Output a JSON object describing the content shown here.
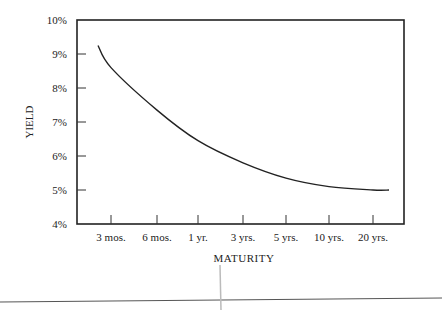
{
  "chart_data": {
    "type": "line",
    "title": "",
    "xlabel": "MATURITY",
    "ylabel": "YIELD",
    "categories": [
      "3 mos.",
      "6 mos.",
      "1 yr.",
      "3 yrs.",
      "5 yrs.",
      "10 yrs.",
      "20 yrs."
    ],
    "yticks": [
      "4%",
      "5%",
      "6%",
      "7%",
      "8%",
      "9%",
      "10%"
    ],
    "ylim": [
      4,
      10
    ],
    "grid": false,
    "legend": null,
    "series": [
      {
        "name": "Yield curve",
        "values": [
          8.6,
          7.35,
          6.45,
          5.8,
          5.35,
          5.1,
          5.0
        ],
        "start_value": 9.25,
        "end_value": 5.0
      }
    ]
  }
}
